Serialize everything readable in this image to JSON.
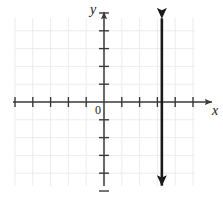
{
  "figure": {
    "kind": "cartesian-coordinate-plane",
    "width": 223,
    "height": 199,
    "background_color": "#ffffff"
  },
  "labels": {
    "x_axis": "x",
    "y_axis": "y",
    "origin": "0"
  },
  "colors": {
    "axis": "#3a3a3a",
    "grid": "#ececec",
    "line": "#1a1a1a",
    "tick": "#3a3a3a"
  },
  "chart_data": {
    "type": "line",
    "title": "",
    "xlabel": "x",
    "ylabel": "y",
    "grid": true,
    "legend": null,
    "xlim": [
      -5,
      6
    ],
    "ylim": [
      -5,
      5
    ],
    "xticks": [
      -5,
      -4,
      -3,
      -2,
      -1,
      1,
      2,
      3,
      4,
      5
    ],
    "yticks": [
      -5,
      -4,
      -3,
      -2,
      -1,
      1,
      2,
      3,
      4,
      5
    ],
    "tick_labels_shown": false,
    "series": [
      {
        "name": "vertical line",
        "equation": "x = 3.25",
        "kind": "vertical-line",
        "x": 3.25,
        "y_from": -4.7,
        "y_to": 4.7,
        "arrows": "both",
        "color": "#1a1a1a",
        "width": 2.6
      }
    ],
    "annotations": []
  },
  "geometry": {
    "origin_px": {
      "x": 104,
      "y": 102
    },
    "unit_px": 17.8,
    "grid_box": {
      "left": 15,
      "top": 18,
      "right": 195,
      "bottom": 186
    },
    "x_axis_px": {
      "x1": 13,
      "x2": 212,
      "y": 102
    },
    "y_axis_px": {
      "x": 104,
      "y1": 12,
      "y2": 186
    },
    "vertical_line_px": {
      "x": 162,
      "y1": 19,
      "y2": 180
    },
    "tick_half_len": 5
  }
}
